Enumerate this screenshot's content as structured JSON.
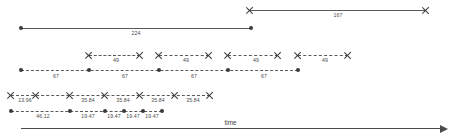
{
  "diagram": {
    "axis": {
      "label": "time",
      "x1": 21,
      "x2": 440,
      "y": 128
    },
    "colors": {
      "line": "#5a5a5a",
      "marker": "#3a3a3a",
      "text": "#4a4a4a",
      "axis": "#4a4a4a"
    },
    "rows": [
      {
        "name": "row-167",
        "y": 10,
        "marker": "cross",
        "style": "solid",
        "points": [
          250,
          426
        ],
        "labels": [
          {
            "value": "167",
            "x": 338,
            "y": 13
          }
        ]
      },
      {
        "name": "row-224",
        "y": 28,
        "marker": "dot",
        "style": "solid",
        "points": [
          21,
          251
        ],
        "labels": [
          {
            "value": "224",
            "x": 136,
            "y": 31
          }
        ]
      },
      {
        "name": "row-49",
        "y": 55,
        "marker": "cross",
        "style": "dashed",
        "segments": [
          {
            "x1": 89,
            "x2": 140,
            "label": "49",
            "lx": 116,
            "ly": 58
          },
          {
            "x1": 159,
            "x2": 209,
            "label": "49",
            "lx": 186,
            "ly": 58
          },
          {
            "x1": 228,
            "x2": 278,
            "label": "49",
            "lx": 256,
            "ly": 58
          },
          {
            "x1": 298,
            "x2": 348,
            "label": "49",
            "lx": 325,
            "ly": 58
          }
        ]
      },
      {
        "name": "row-67",
        "y": 70,
        "marker": "dot",
        "style": "dashed",
        "points": [
          21,
          89,
          159,
          228,
          298
        ],
        "labels": [
          {
            "value": "67",
            "x": 56,
            "y": 74
          },
          {
            "value": "67",
            "x": 125,
            "y": 74
          },
          {
            "value": "67",
            "x": 194,
            "y": 74
          },
          {
            "value": "67",
            "x": 264,
            "y": 74
          }
        ]
      },
      {
        "name": "row-3584",
        "y": 95,
        "marker": "cross",
        "style": "dashed",
        "points": [
          11,
          36,
          70,
          105,
          140,
          175,
          210
        ],
        "labels": [
          {
            "value": "13.96",
            "x": 25,
            "y": 98
          },
          {
            "value": "35.84",
            "x": 88,
            "y": 98
          },
          {
            "value": "35.84",
            "x": 123,
            "y": 98
          },
          {
            "value": "35.84",
            "x": 158,
            "y": 98
          },
          {
            "value": "35.84",
            "x": 193,
            "y": 98
          }
        ]
      },
      {
        "name": "row-1947",
        "y": 111,
        "marker": "dot",
        "style": "dashed",
        "points": [
          11,
          70,
          105,
          124,
          143,
          162
        ],
        "labels": [
          {
            "value": "46.12",
            "x": 43,
            "y": 114
          },
          {
            "value": "19.47",
            "x": 88,
            "y": 114
          },
          {
            "value": "19.47",
            "x": 114,
            "y": 114
          },
          {
            "value": "19.47",
            "x": 133,
            "y": 114
          },
          {
            "value": "19.47",
            "x": 152,
            "y": 114
          }
        ]
      }
    ]
  }
}
